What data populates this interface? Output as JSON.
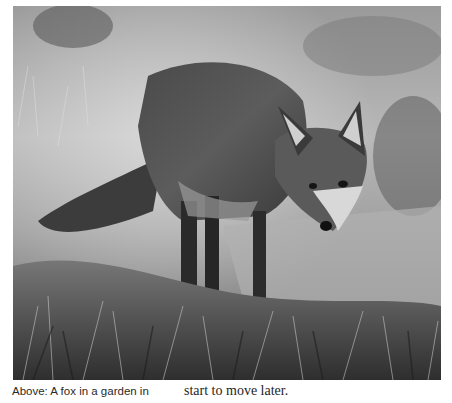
{
  "figure": {
    "style": "black-and-white photograph"
  },
  "caption": {
    "left_column": "Above: A fox in a garden in",
    "right_column": "start to move later."
  }
}
